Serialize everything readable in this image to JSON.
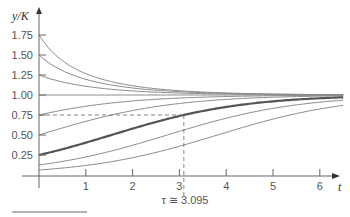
{
  "chart_data": {
    "type": "line",
    "title": "",
    "xlabel": "t",
    "ylabel": "y/K",
    "xlim": [
      0,
      6.5
    ],
    "ylim": [
      0,
      1.9
    ],
    "grid": false,
    "legend": null,
    "x_ticks": [
      "1",
      "2",
      "3",
      "4",
      "5",
      "6"
    ],
    "y_ticks": [
      "0.25",
      "0.50",
      "0.75",
      "1.00",
      "1.25",
      "1.50",
      "1.75"
    ],
    "model": "logistic: y/K = 1 / (1 + (1/y0 - 1) e^(-r t)), r ≈ 0.71",
    "growth_rate_r": 0.71,
    "series": [
      {
        "name": "y0=1.75",
        "y0": 1.75,
        "highlight": false
      },
      {
        "name": "y0=1.50",
        "y0": 1.5,
        "highlight": false
      },
      {
        "name": "y0=1.25",
        "y0": 1.25,
        "highlight": false
      },
      {
        "name": "y0=1.00",
        "y0": 1.0,
        "highlight": false
      },
      {
        "name": "y0=0.75",
        "y0": 0.75,
        "highlight": false
      },
      {
        "name": "y0=0.50",
        "y0": 0.5,
        "highlight": false
      },
      {
        "name": "y0=0.25",
        "y0": 0.25,
        "highlight": true
      },
      {
        "name": "y0=0.125",
        "y0": 0.125,
        "highlight": false
      },
      {
        "name": "y0=0.0625",
        "y0": 0.0625,
        "highlight": false
      }
    ],
    "annotations": [
      {
        "type": "hline-dashed",
        "y": 0.75,
        "x_from": 0,
        "x_to": 3.095
      },
      {
        "type": "vline-dashed",
        "x": 3.095,
        "y_from": 0,
        "y_to": 0.75
      },
      {
        "type": "text",
        "text": "τ ≅ 3.095",
        "x": 3.095
      }
    ]
  },
  "labels": {
    "ylabel": "y/K",
    "xlabel": "t",
    "tau": "τ ≅ 3.095"
  },
  "colors": {
    "curve": "#8a8a8a",
    "highlight": "#555555",
    "axis": "#666666",
    "text": "#555555"
  }
}
